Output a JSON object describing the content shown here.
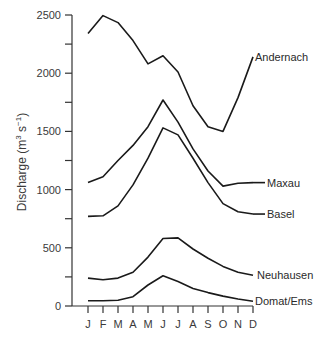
{
  "chart_data": {
    "type": "line",
    "title": "",
    "xlabel": "",
    "ylabel": "Discharge (m³ s⁻¹)",
    "ylabel_parts": {
      "main": "Discharge (m",
      "sup1": "3",
      "mid": " s",
      "sup2": "−1",
      "end": ")"
    },
    "categories": [
      "J",
      "F",
      "M",
      "A",
      "M",
      "J",
      "J",
      "A",
      "S",
      "O",
      "N",
      "D"
    ],
    "ylim": [
      0,
      2500
    ],
    "yticks": [
      0,
      500,
      1000,
      1500,
      2000,
      2500
    ],
    "yminor_ticks": [
      250,
      750,
      1250,
      1750,
      2250
    ],
    "grid": false,
    "legend_position": "inline-right",
    "series": [
      {
        "name": "Andernach",
        "values": [
          2340,
          2495,
          2435,
          2280,
          2080,
          2150,
          2010,
          1720,
          1540,
          1500,
          1790,
          2140
        ]
      },
      {
        "name": "Maxau",
        "values": [
          1060,
          1110,
          1250,
          1380,
          1540,
          1770,
          1580,
          1350,
          1160,
          1030,
          1055,
          1060
        ]
      },
      {
        "name": "Basel",
        "values": [
          770,
          775,
          860,
          1040,
          1270,
          1530,
          1470,
          1270,
          1060,
          880,
          810,
          790
        ]
      },
      {
        "name": "Neuhausen",
        "values": [
          240,
          225,
          240,
          290,
          420,
          580,
          585,
          490,
          410,
          340,
          290,
          265
        ]
      },
      {
        "name": "Domat/Ems",
        "values": [
          45,
          45,
          50,
          80,
          180,
          260,
          210,
          150,
          115,
          85,
          60,
          40
        ]
      }
    ],
    "label_positions": [
      {
        "name": "Andernach",
        "month_index": 11,
        "value": 2140,
        "dx": 2,
        "dy": 0
      },
      {
        "name": "Maxau",
        "month_index": 11,
        "value": 1060,
        "dx": 14,
        "dy": 0
      },
      {
        "name": "Basel",
        "month_index": 11,
        "value": 790,
        "dx": 14,
        "dy": 0
      },
      {
        "name": "Neuhausen",
        "month_index": 11,
        "value": 265,
        "dx": 4,
        "dy": 0
      },
      {
        "name": "Domat/Ems",
        "month_index": 11,
        "value": 40,
        "dx": 2,
        "dy": 0
      }
    ],
    "colors": {
      "line": "#1a1a1a",
      "axis": "#333333",
      "text": "#3a3a3a"
    }
  }
}
